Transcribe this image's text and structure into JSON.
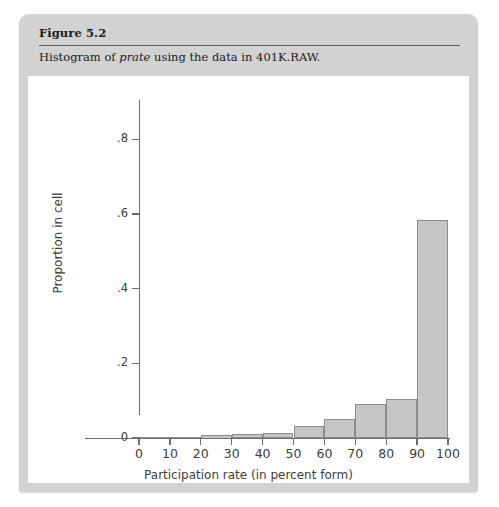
{
  "figure": {
    "title": "Figure 5.2",
    "caption_prefix": "Histogram of ",
    "caption_emphasis": "prate",
    "caption_suffix": " using the data in 401K.RAW."
  },
  "colors": {
    "card_background": "#d2d2d2",
    "panel_background": "#ffffff",
    "bar_fill": "#c6c6c6",
    "bar_edge": "#8c8c8c",
    "axis": "#6f6f6f",
    "text": "#3d3d3d"
  },
  "chart_data": {
    "type": "bar",
    "title": "",
    "xlabel": "Participation rate (in percent form)",
    "ylabel": "Proportion in cell",
    "categories": [
      "0-10",
      "10-20",
      "20-30",
      "30-40",
      "40-50",
      "50-60",
      "60-70",
      "70-80",
      "80-90",
      "90-100"
    ],
    "bin_edges": [
      0,
      10,
      20,
      30,
      40,
      50,
      60,
      70,
      80,
      90,
      100
    ],
    "values": [
      0.001,
      0.002,
      0.008,
      0.01,
      0.014,
      0.033,
      0.05,
      0.092,
      0.104,
      0.585
    ],
    "xlim": [
      0,
      100
    ],
    "ylim": [
      0,
      0.9
    ],
    "xticks": [
      "0",
      "10",
      "20",
      "30",
      "40",
      "50",
      "60",
      "70",
      "80",
      "90",
      "100"
    ],
    "xtick_values": [
      0,
      10,
      20,
      30,
      40,
      50,
      60,
      70,
      80,
      90,
      100
    ],
    "yticks": [
      "0",
      ".2",
      ".4",
      ".6",
      ".8"
    ],
    "ytick_values": [
      0,
      0.2,
      0.4,
      0.6,
      0.8
    ],
    "grid": false,
    "legend": null
  }
}
